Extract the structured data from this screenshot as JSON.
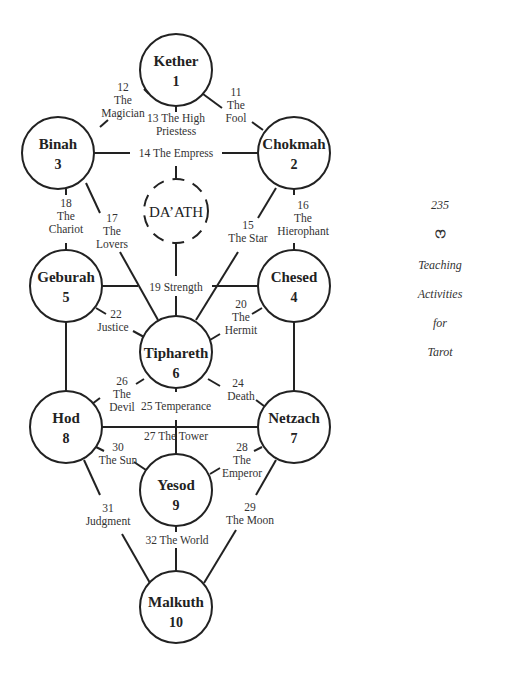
{
  "sephiroth": [
    {
      "name": "Kether",
      "num": "1"
    },
    {
      "name": "Chokmah",
      "num": "2"
    },
    {
      "name": "Binah",
      "num": "3"
    },
    {
      "name": "Chesed",
      "num": "4"
    },
    {
      "name": "Geburah",
      "num": "5"
    },
    {
      "name": "Tiphareth",
      "num": "6"
    },
    {
      "name": "Netzach",
      "num": "7"
    },
    {
      "name": "Hod",
      "num": "8"
    },
    {
      "name": "Yesod",
      "num": "9"
    },
    {
      "name": "Malkuth",
      "num": "10"
    }
  ],
  "daath": {
    "name": "DA’ATH"
  },
  "paths": {
    "p11": [
      "11",
      "The",
      "Fool"
    ],
    "p12": [
      "12",
      "The",
      "Magician"
    ],
    "p13": [
      "13 The High",
      "Priestess"
    ],
    "p14": [
      "14 The Empress"
    ],
    "p15": [
      "15",
      "The Star"
    ],
    "p16": [
      "16",
      "The",
      "Hierophant"
    ],
    "p17": [
      "17",
      "The",
      "Lovers"
    ],
    "p18": [
      "18",
      "The",
      "Chariot"
    ],
    "p19": [
      "19 Strength"
    ],
    "p20": [
      "20",
      "The",
      "Hermit"
    ],
    "p22": [
      "22",
      "Justice"
    ],
    "p24": [
      "24",
      "Death"
    ],
    "p25": [
      "25 Temperance"
    ],
    "p26": [
      "26",
      "The",
      "Devil"
    ],
    "p27": [
      "27 The Tower"
    ],
    "p28": [
      "28",
      "The",
      "Emperor"
    ],
    "p29": [
      "29",
      "The Moon"
    ],
    "p30": [
      "30",
      "The Sun"
    ],
    "p31": [
      "31",
      "Judgment"
    ],
    "p32": [
      "32 The World"
    ]
  },
  "sidebar": {
    "page_number": "235",
    "ornament": "ෆ",
    "lines": [
      "Teaching",
      "Activities",
      "for",
      "Tarot"
    ]
  }
}
